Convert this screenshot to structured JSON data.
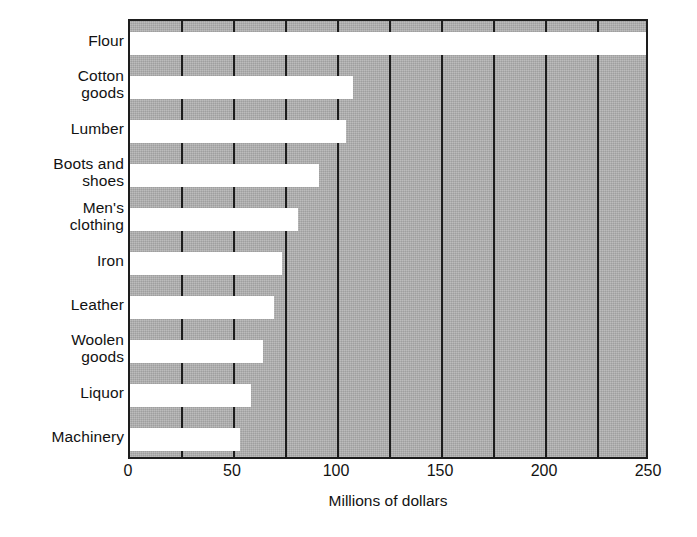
{
  "chart_data": {
    "type": "bar",
    "orientation": "horizontal",
    "title": "",
    "xlabel": "Millions of dollars",
    "ylabel": "",
    "xlim": [
      0,
      250
    ],
    "grid": true,
    "grid_axis": "x",
    "legend": false,
    "xticks_major": [
      0,
      50,
      100,
      150,
      200,
      250
    ],
    "xtick_labels": [
      "0",
      "50",
      "100",
      "150",
      "200",
      "250"
    ],
    "gridline_values": [
      0,
      25,
      50,
      75,
      100,
      125,
      150,
      175,
      200,
      225,
      250
    ],
    "categories": [
      "Flour",
      "Cotton\ngoods",
      "Lumber",
      "Boots and\nshoes",
      "Men's\nclothing",
      "Iron",
      "Leather",
      "Woolen\ngoods",
      "Liquor",
      "Machinery"
    ],
    "values": [
      248,
      107,
      104,
      91,
      81,
      73,
      69,
      64,
      58,
      53
    ],
    "bars": [
      {
        "label": "Flour",
        "value": 248
      },
      {
        "label": "Cotton goods",
        "value": 107
      },
      {
        "label": "Lumber",
        "value": 104
      },
      {
        "label": "Boots and shoes",
        "value": 91
      },
      {
        "label": "Men's clothing",
        "value": 81
      },
      {
        "label": "Iron",
        "value": 73
      },
      {
        "label": "Leather",
        "value": 69
      },
      {
        "label": "Woolen goods",
        "value": 64
      },
      {
        "label": "Liquor",
        "value": 58
      },
      {
        "label": "Machinery",
        "value": 53
      }
    ],
    "colors": {
      "plot_background": "#adadad",
      "bar_fill": "#ffffff",
      "gridline": "#1d1d1d",
      "axis_border": "#1d1d1d",
      "text": "#121212",
      "page_background": "#ffffff"
    }
  }
}
